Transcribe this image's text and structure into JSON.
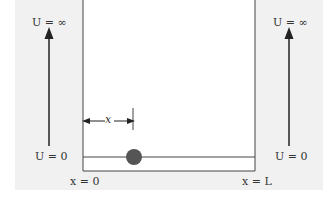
{
  "diagram": {
    "type": "infinite-square-well",
    "left_potential": {
      "top_label": "U = ∞",
      "bottom_label": "U = 0"
    },
    "right_potential": {
      "top_label": "U = ∞",
      "bottom_label": "U = 0"
    },
    "position_marker_label": "x",
    "left_wall_label": "x = 0",
    "right_wall_label": "x = L",
    "particle": "ball",
    "colors": {
      "panel_bg": "#f1f1f1",
      "well_bg": "#ffffff",
      "line": "#444444",
      "ball": "#555555"
    }
  }
}
